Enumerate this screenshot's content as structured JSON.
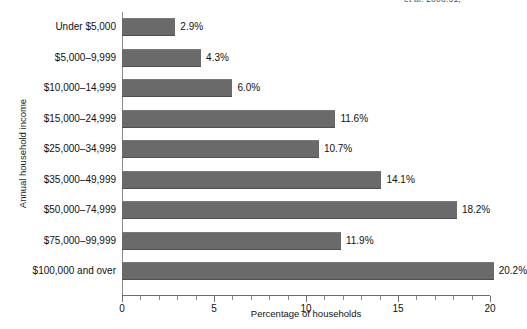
{
  "figure": {
    "citation_fragment": "et al. 2008:31,"
  },
  "chart_data": {
    "type": "bar",
    "orientation": "horizontal",
    "title": "",
    "xlabel": "Percentage of households",
    "ylabel": "Annual household income",
    "xlim": [
      0,
      20
    ],
    "xticks": [
      0,
      5,
      10,
      15,
      20
    ],
    "xtick_labels": [
      "0",
      "5",
      "10",
      "15",
      "20"
    ],
    "minor_tick_step": 1,
    "grid": false,
    "legend": null,
    "bar_color": "#6a6a6a",
    "value_suffix": "%",
    "categories": [
      "Under $5,000",
      "$5,000–9,999",
      "$10,000–14,999",
      "$15,000–24,999",
      "$25,000–34,999",
      "$35,000–49,999",
      "$50,000–74,999",
      "$75,000–99,999",
      "$100,000 and over"
    ],
    "values": [
      2.9,
      4.3,
      6.0,
      11.6,
      10.7,
      14.1,
      18.2,
      11.9,
      20.2
    ],
    "value_labels": [
      "2.9%",
      "4.3%",
      "6.0%",
      "11.6%",
      "10.7%",
      "14.1%",
      "18.2%",
      "11.9%",
      "20.2%"
    ]
  }
}
